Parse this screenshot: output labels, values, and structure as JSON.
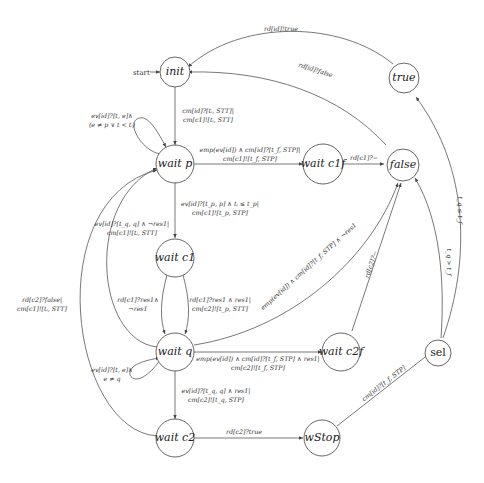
{
  "diagram": {
    "type": "state-machine",
    "start_label": "start",
    "nodes": {
      "init": "init",
      "wait_p": "wait p",
      "wait_c1f": "wait c1f",
      "false": "false",
      "true": "true",
      "wait_c1": "wait c1",
      "wait_q": "wait q",
      "wait_c2f": "wait c2f",
      "sel": "sel",
      "wait_c2": "wait c2",
      "wStop": "wStop"
    },
    "edges": {
      "true_to_init": "rd[id]!true",
      "false_to_init": "rd[id]!false",
      "init_to_waitp_1": "cm[id]?[tᵢ, STT]|",
      "init_to_waitp_2": "cm[c1]![tᵢ, STT]",
      "waitp_self_1": "ev[id]?[t, e]∧",
      "waitp_self_2": "(e ≠ p ∨ t < tᵢ)",
      "waitp_to_waitc1f_1": "emp(ev[id]) ∧ cm[id]?[t_f, STP]|",
      "waitp_to_waitc1f_2": "cm[c1]![t_f, STP]",
      "waitc1f_to_false": "rd[c1]?−",
      "waitp_to_waitc1_1": "ev[id]?[t_p, p] ∧ tᵢ ≤ t_p|",
      "waitp_to_waitc1_2": "cm[c1]![t_p, STP]",
      "waitq_to_waitp_1": "ev[id]?[t_q, q] ∧ ¬res1|",
      "waitq_to_waitp_2": "cm[c1]![tᵢ, STT]",
      "waitc1_to_waitq_left_1": "rd[c1]?res1∧",
      "waitc1_to_waitq_left_2": "¬res1",
      "waitc1_to_waitq_right_1": "rd[c1]?res1 ∧ res1|",
      "waitc1_to_waitq_right_2": "cm[c2]![t_p, STT]",
      "waitq_to_false_long": "emp(ev[id]) ∧ cm[id]?[t_f, STP] ∧ ¬res1",
      "waitc2f_to_false": "rd[c2]?−",
      "waitq_to_waitc2f_1": "emp(ev[id]) ∧ cm[id]?[t_f, STP] ∧ res1|",
      "waitq_to_waitc2f_2": "cm[c2]![t_f, STP]",
      "waitq_self_1": "ev[id]?[t, e]∧",
      "waitq_self_2": "e ≠ q",
      "waitc2_to_waitp_1": "rd[c2]?false|",
      "waitc2_to_waitp_2": "cm[c1]![tᵢ, STT]",
      "waitq_to_waitc2_1": "ev[id]?[t_q, q] ∧ res1|",
      "waitq_to_waitc2_2": "cm[c2]![t_q, STP]",
      "waitc2_to_wStop": "rd[c2]?true",
      "wStop_to_sel": "cm[id]?[t_f, STP]",
      "sel_to_false": "t_q > t_f",
      "sel_to_true": "t_q ≤ t_f"
    }
  }
}
